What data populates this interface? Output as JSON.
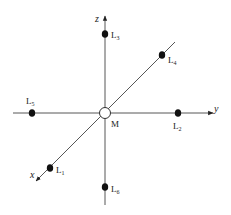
{
  "diagram": {
    "center": {
      "label": "M",
      "x": 105,
      "y": 113
    },
    "axes": [
      {
        "name": "z",
        "from": [
          105,
          205
        ],
        "to": [
          105,
          16
        ],
        "label_pos": [
          95,
          22
        ]
      },
      {
        "name": "y",
        "from": [
          13,
          113
        ],
        "to": [
          213,
          113
        ],
        "label_pos": [
          214,
          112
        ]
      },
      {
        "name": "x",
        "from": [
          175,
          42
        ],
        "to": [
          36,
          181
        ],
        "label_pos": [
          30,
          178
        ]
      }
    ],
    "points": [
      {
        "id": "L1",
        "base": "L",
        "sub": "1",
        "x": 50,
        "y": 168,
        "lx": 56,
        "ly": 173
      },
      {
        "id": "L2",
        "base": "L",
        "sub": "2",
        "x": 178,
        "y": 113,
        "lx": 173,
        "ly": 129
      },
      {
        "id": "L3",
        "base": "L",
        "sub": "3",
        "x": 105,
        "y": 34,
        "lx": 111,
        "ly": 38
      },
      {
        "id": "L4",
        "base": "L",
        "sub": "4",
        "x": 162,
        "y": 55,
        "lx": 168,
        "ly": 63
      },
      {
        "id": "L5",
        "base": "L",
        "sub": "5",
        "x": 32,
        "y": 113,
        "lx": 26,
        "ly": 104
      },
      {
        "id": "L6",
        "base": "L",
        "sub": "6",
        "x": 105,
        "y": 187,
        "lx": 111,
        "ly": 192
      }
    ],
    "center_label": "M"
  }
}
